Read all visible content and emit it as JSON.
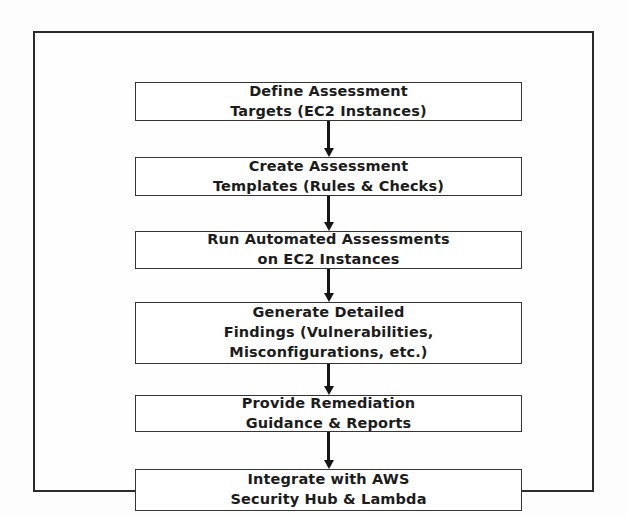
{
  "diagram": {
    "type": "vertical-flowchart",
    "title": "",
    "colors": {
      "background": "#fdfdfd",
      "frame_border": "#2b2b2b",
      "box_border": "#353535",
      "box_fill": "#ffffff",
      "text": "#1c1c1c",
      "arrow": "#151515"
    },
    "nodes": [
      {
        "id": "define-assessment-targets",
        "line1": "Define Assessment",
        "line2": "Targets (EC2 Instances)",
        "text": "Define Assessment\nTargets (EC2 Instances)"
      },
      {
        "id": "create-assessment-templates",
        "line1": "Create Assessment",
        "line2": "Templates (Rules & Checks)",
        "text": "Create Assessment\nTemplates (Rules & Checks)"
      },
      {
        "id": "run-automated-assessments",
        "line1": "Run Automated Assessments",
        "line2": "on EC2 Instances",
        "text": "Run Automated Assessments\non EC2 Instances"
      },
      {
        "id": "generate-detailed-findings",
        "line1": "Generate Detailed",
        "line2": "Findings (Vulnerabilities,",
        "line3": "Misconfigurations, etc.)",
        "text": "Generate Detailed\nFindings (Vulnerabilities,\nMisconfigurations, etc.)"
      },
      {
        "id": "provide-remediation-guidance",
        "line1": "Provide Remediation",
        "line2": "Guidance & Reports",
        "text": "Provide Remediation\nGuidance & Reports"
      },
      {
        "id": "integrate-with-aws",
        "line1": "Integrate with AWS",
        "line2": "Security Hub & Lambda",
        "text": "Integrate with AWS\nSecurity Hub & Lambda"
      }
    ],
    "connectors": [
      {
        "id": "arrow-0",
        "from": "define-assessment-targets",
        "to": "create-assessment-templates",
        "direction": "down"
      },
      {
        "id": "arrow-1",
        "from": "create-assessment-templates",
        "to": "run-automated-assessments",
        "direction": "down"
      },
      {
        "id": "arrow-2",
        "from": "run-automated-assessments",
        "to": "generate-detailed-findings",
        "direction": "down"
      },
      {
        "id": "arrow-3",
        "from": "generate-detailed-findings",
        "to": "provide-remediation-guidance",
        "direction": "down"
      },
      {
        "id": "arrow-4",
        "from": "provide-remediation-guidance",
        "to": "integrate-with-aws",
        "direction": "down"
      }
    ]
  }
}
